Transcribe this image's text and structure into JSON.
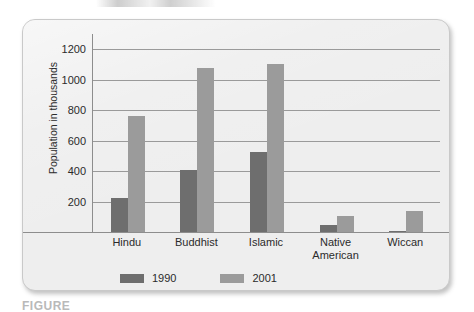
{
  "chart_data": {
    "type": "bar",
    "title": "",
    "xlabel": "",
    "ylabel": "Population in thousands",
    "ylim": [
      0,
      1300
    ],
    "grid": true,
    "legend_position": "bottom-left",
    "categories": [
      "Hindu",
      "Buddhist",
      "Islamic",
      "Native American",
      "Wiccan"
    ],
    "yticks": [
      200,
      400,
      600,
      800,
      1000,
      1200
    ],
    "series": [
      {
        "name": "1990",
        "color": "#6e6e6e",
        "values": [
          225,
          410,
          525,
          45,
          8
        ]
      },
      {
        "name": "2001",
        "color": "#9b9b9b",
        "values": [
          765,
          1075,
          1100,
          105,
          135
        ]
      }
    ]
  },
  "axis": {
    "y_title": "Population in thousands",
    "ticks": [
      {
        "label": "1200",
        "value": 1200
      },
      {
        "label": "1000",
        "value": 1000
      },
      {
        "label": "800",
        "value": 800
      },
      {
        "label": "600",
        "value": 600
      },
      {
        "label": "400",
        "value": 400
      },
      {
        "label": "200",
        "value": 200
      }
    ]
  },
  "categories": [
    {
      "label": "Hindu",
      "line1": "Hindu",
      "line2": ""
    },
    {
      "label": "Buddhist",
      "line1": "Buddhist",
      "line2": ""
    },
    {
      "label": "Islamic",
      "line1": "Islamic",
      "line2": ""
    },
    {
      "label": "Native American",
      "line1": "Native",
      "line2": "American"
    },
    {
      "label": "Wiccan",
      "line1": "Wiccan",
      "line2": ""
    }
  ],
  "legend": [
    {
      "label": "1990",
      "color": "#6e6e6e"
    },
    {
      "label": "2001",
      "color": "#9b9b9b"
    }
  ],
  "caption": {
    "text": "FIGURE"
  },
  "colors": {
    "card_bg": "#eeeeee",
    "card_border": "#c9c9c9",
    "gridline": "#9a9a9a",
    "axis_line": "#8d8d8d",
    "text": "#2b2b2b",
    "series_1990": "#6e6e6e",
    "series_2001": "#9b9b9b"
  }
}
